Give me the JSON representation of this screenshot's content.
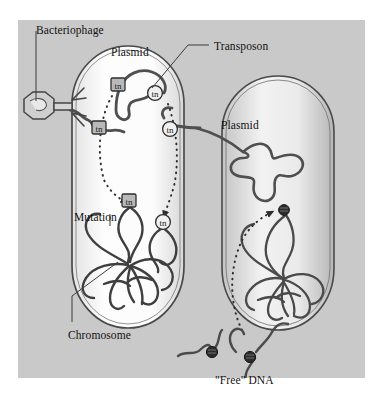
{
  "figure": {
    "background_color": "#c9c9c9",
    "page_color": "#ffffff",
    "ink_color": "#3a3a3a"
  },
  "labels": [
    {
      "id": "bacteriophage",
      "text": "Bacteriophage",
      "x": 36,
      "y": 25
    },
    {
      "id": "plasmid_left",
      "text": "Plasmid",
      "x": 111,
      "y": 47
    },
    {
      "id": "transposon",
      "text": "Transposon",
      "x": 214,
      "y": 41
    },
    {
      "id": "plasmid_right",
      "text": "Plasmid",
      "x": 221,
      "y": 120
    },
    {
      "id": "mutation",
      "text": "Mutation",
      "x": 74,
      "y": 212
    },
    {
      "id": "chromosome",
      "text": "Chromosome",
      "x": 68,
      "y": 330
    },
    {
      "id": "free_dna",
      "text": "\"Free\" DNA",
      "x": 215,
      "y": 375
    }
  ],
  "markers": {
    "transposon_symbol": "tn",
    "square_sites": [
      {
        "id": "tn-plasmid-left-square",
        "x": 118,
        "y": 85
      },
      {
        "id": "tn-phage-dna-square",
        "x": 99,
        "y": 128
      },
      {
        "id": "tn-chromosome-square",
        "x": 129,
        "y": 201
      }
    ],
    "circle_sites": [
      {
        "id": "tn-plasmid-left-circle",
        "x": 155,
        "y": 93
      },
      {
        "id": "tn-plasmid-bridge-circle",
        "x": 170,
        "y": 129
      },
      {
        "id": "tn-chromosome-circle",
        "x": 163,
        "y": 222
      }
    ],
    "dark_sites": [
      {
        "id": "tn-right-chromosome-dark",
        "x": 284,
        "y": 210
      },
      {
        "id": "tn-free-dna-dark-left",
        "x": 212,
        "y": 352
      },
      {
        "id": "tn-free-dna-dark-right",
        "x": 250,
        "y": 357
      }
    ]
  },
  "cells": [
    {
      "id": "left-bacterium",
      "shape": "rod",
      "has_plasmid": true,
      "has_chromosome": true
    },
    {
      "id": "right-bacterium",
      "shape": "rod",
      "has_plasmid": true,
      "has_chromosome": true
    }
  ],
  "transfer_arrows": [
    {
      "id": "arrow-plasmid-to-chromosome-left",
      "style": "dotted"
    },
    {
      "id": "arrow-plasmid-to-chromosome-right",
      "style": "dotted"
    },
    {
      "id": "arrow-free-dna-to-chromosome",
      "style": "dotted"
    }
  ]
}
